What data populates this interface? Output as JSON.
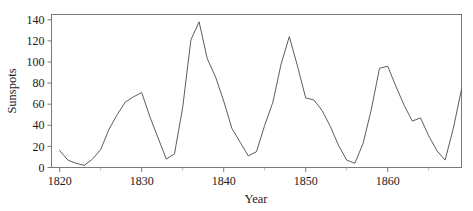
{
  "chart_data": {
    "type": "line",
    "title": "",
    "subtitle": "",
    "xlabel": "Year",
    "ylabel": "Sunspots",
    "xlim": [
      1819,
      1869
    ],
    "ylim": [
      0,
      145
    ],
    "grid": false,
    "legend": null,
    "legend_position": "none",
    "x_ticks": [
      1820,
      1830,
      1840,
      1850,
      1860
    ],
    "x_tick_labels": [
      "1820",
      "1830",
      "1840",
      "1850",
      "1860"
    ],
    "x_minor_ticks": [
      1825,
      1835,
      1845,
      1855,
      1865
    ],
    "y_ticks": [
      0,
      20,
      40,
      60,
      80,
      100,
      120,
      140
    ],
    "y_tick_labels": [
      "0",
      "20",
      "40",
      "60",
      "80",
      "100",
      "120",
      "140"
    ],
    "series_name": "Sunspots",
    "line_color": "#4a4a4a",
    "x": [
      1820,
      1821,
      1822,
      1823,
      1824,
      1825,
      1826,
      1827,
      1828,
      1829,
      1830,
      1831,
      1832,
      1833,
      1834,
      1835,
      1836,
      1837,
      1838,
      1839,
      1840,
      1841,
      1842,
      1843,
      1844,
      1845,
      1846,
      1847,
      1848,
      1849,
      1850,
      1851,
      1852,
      1853,
      1854,
      1855,
      1856,
      1857,
      1858,
      1859,
      1860,
      1861,
      1862,
      1863,
      1864,
      1865,
      1866,
      1867,
      1868,
      1869
    ],
    "y": [
      16,
      7,
      4,
      2,
      8,
      17,
      36,
      50,
      62,
      67,
      71,
      48,
      28,
      8,
      13,
      57,
      121,
      138,
      103,
      86,
      63,
      37,
      24,
      11,
      15,
      40,
      62,
      98,
      124,
      96,
      66,
      64,
      54,
      39,
      21,
      7,
      4,
      23,
      55,
      94,
      96,
      77,
      59,
      44,
      47,
      30,
      16,
      7,
      37,
      74
    ]
  },
  "axes": {
    "y_label": "Sunspots",
    "x_label": "Year"
  }
}
